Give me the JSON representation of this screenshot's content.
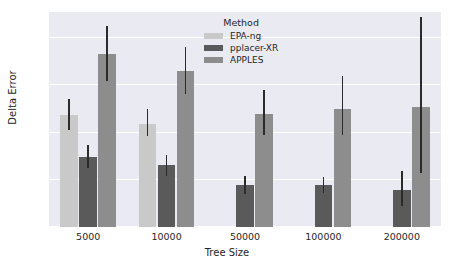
{
  "chart_data": {
    "type": "bar",
    "title": "",
    "xlabel": "Tree Size",
    "ylabel": "Delta Error",
    "categories": [
      "5000",
      "10000",
      "50000",
      "100000",
      "200000"
    ],
    "ylim": [
      0.0,
      0.455
    ],
    "yticks": [
      "0.0",
      "0.1",
      "0.2",
      "0.3",
      "0.4"
    ],
    "ytick_values": [
      0.0,
      0.1,
      0.2,
      0.3,
      0.4
    ],
    "grid": true,
    "legend_position": "upper center",
    "legend_title": "Method",
    "series": [
      {
        "name": "EPA-ng",
        "color": "#c9c9c9",
        "values": [
          0.236,
          0.217,
          null,
          null,
          null
        ],
        "err_low": [
          0.205,
          0.192,
          null,
          null,
          null
        ],
        "err_high": [
          0.271,
          0.249,
          null,
          null,
          null
        ]
      },
      {
        "name": "pplacer-XR",
        "color": "#5a5a5a",
        "values": [
          0.149,
          0.131,
          0.088,
          0.088,
          0.078
        ],
        "err_low": [
          0.124,
          0.107,
          0.07,
          0.072,
          0.045
        ],
        "err_high": [
          0.173,
          0.153,
          0.107,
          0.105,
          0.118
        ]
      },
      {
        "name": "APPLES",
        "color": "#8d8d8d",
        "values": [
          0.367,
          0.33,
          0.24,
          0.25,
          0.253
        ],
        "err_low": [
          0.308,
          0.282,
          0.194,
          0.194,
          0.115
        ],
        "err_high": [
          0.426,
          0.382,
          0.291,
          0.32,
          0.445
        ]
      }
    ]
  },
  "style": {
    "plot_background": "#eaeaf2",
    "figure_background": "#ffffff",
    "gridline_color": "#ffffff",
    "error_bar_color": "#2b2b2b",
    "text_color": "#262626"
  }
}
